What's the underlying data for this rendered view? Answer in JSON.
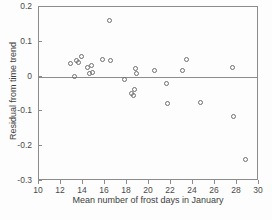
{
  "chart_data": {
    "type": "scatter",
    "title": "",
    "xlabel": "Mean number of frost days in January",
    "ylabel": "Residual from time trend",
    "xlim": [
      10,
      30
    ],
    "ylim": [
      -0.3,
      0.2
    ],
    "xticks": [
      10,
      12,
      14,
      16,
      18,
      20,
      22,
      24,
      26,
      28,
      30
    ],
    "xticklabels": [
      "10",
      "12",
      "14",
      "16",
      "18",
      "20",
      "22",
      "24",
      "26",
      "28",
      "30"
    ],
    "yticks": [
      0.2,
      0.1,
      0,
      -0.1,
      -0.2,
      -0.3
    ],
    "yticklabels": [
      "0.2",
      "0.1",
      "0",
      "-0.1",
      "-0.2",
      "-0.3"
    ],
    "grid": false,
    "legend": null,
    "reference_line": {
      "type": "horizontal",
      "y": 0
    },
    "marker": {
      "shape": "circle",
      "filled": false,
      "color": "#6f6f6f",
      "size": 5
    },
    "points": [
      {
        "x": 12.9,
        "y": 0.038
      },
      {
        "x": 13.2,
        "y": 0.0
      },
      {
        "x": 13.4,
        "y": 0.046
      },
      {
        "x": 13.6,
        "y": 0.04
      },
      {
        "x": 13.9,
        "y": 0.057
      },
      {
        "x": 14.4,
        "y": 0.026
      },
      {
        "x": 14.6,
        "y": 0.01
      },
      {
        "x": 14.8,
        "y": 0.033
      },
      {
        "x": 14.85,
        "y": 0.013
      },
      {
        "x": 15.8,
        "y": 0.05
      },
      {
        "x": 16.4,
        "y": 0.162
      },
      {
        "x": 16.5,
        "y": 0.046
      },
      {
        "x": 17.8,
        "y": -0.008
      },
      {
        "x": 18.4,
        "y": -0.048
      },
      {
        "x": 18.55,
        "y": -0.053
      },
      {
        "x": 18.7,
        "y": -0.038
      },
      {
        "x": 18.75,
        "y": 0.024
      },
      {
        "x": 18.85,
        "y": 0.009
      },
      {
        "x": 20.5,
        "y": 0.017
      },
      {
        "x": 21.6,
        "y": -0.019
      },
      {
        "x": 21.7,
        "y": -0.077
      },
      {
        "x": 23.0,
        "y": 0.018
      },
      {
        "x": 23.4,
        "y": 0.048
      },
      {
        "x": 24.7,
        "y": -0.074
      },
      {
        "x": 27.6,
        "y": 0.026
      },
      {
        "x": 27.7,
        "y": -0.114
      },
      {
        "x": 28.8,
        "y": -0.238
      }
    ]
  },
  "axes": {
    "frame_color": "#8c8c8c"
  }
}
